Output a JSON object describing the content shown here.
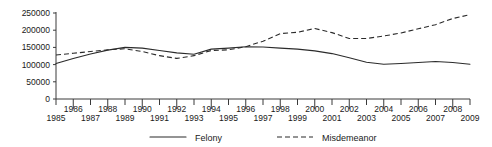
{
  "chart_data": {
    "type": "line",
    "title": "",
    "subtitle": "",
    "xlabel": "",
    "ylabel": "",
    "xlim": [
      1985,
      2009
    ],
    "ylim": [
      0,
      250000
    ],
    "grid": false,
    "legend_position": "bottom",
    "x": [
      1985,
      1986,
      1987,
      1988,
      1989,
      1990,
      1991,
      1992,
      1993,
      1994,
      1995,
      1996,
      1997,
      1998,
      1999,
      2000,
      2001,
      2002,
      2003,
      2004,
      2005,
      2006,
      2007,
      2008,
      2009
    ],
    "categories": [
      "1985",
      "1986",
      "1987",
      "1988",
      "1989",
      "1990",
      "1991",
      "1992",
      "1993",
      "1994",
      "1995",
      "1996",
      "1997",
      "1998",
      "1999",
      "2000",
      "2001",
      "2002",
      "2003",
      "2004",
      "2005",
      "2006",
      "2007",
      "2008",
      "2009"
    ],
    "ytick_labels": [
      "0",
      "50000",
      "100000",
      "150000",
      "200000",
      "250000"
    ],
    "ytick_values": [
      0,
      50000,
      100000,
      150000,
      200000,
      250000
    ],
    "xtick_labels_bottom": [
      "1985",
      "1987",
      "1989",
      "1991",
      "1993",
      "1995",
      "1997",
      "1999",
      "2001",
      "2003",
      "2005",
      "2007",
      "2009"
    ],
    "xtick_labels_top": [
      "1986",
      "1988",
      "1990",
      "1992",
      "1994",
      "1996",
      "1998",
      "2000",
      "2002",
      "2004",
      "2006",
      "2008"
    ],
    "series": [
      {
        "name": "Felony",
        "style": "solid",
        "color": "#2b2b2b",
        "values": [
          103000,
          118000,
          131000,
          142000,
          150000,
          148000,
          141000,
          134000,
          130000,
          145000,
          148000,
          152000,
          151000,
          148000,
          145000,
          140000,
          132000,
          120000,
          107000,
          101000,
          103000,
          106000,
          109000,
          106000,
          101000
        ]
      },
      {
        "name": "Misdemeanor",
        "style": "dashed",
        "color": "#2b2b2b",
        "values": [
          128000,
          133000,
          138000,
          143000,
          146000,
          138000,
          126000,
          118000,
          126000,
          141000,
          143000,
          152000,
          168000,
          190000,
          194000,
          205000,
          193000,
          176000,
          176000,
          183000,
          192000,
          204000,
          216000,
          234000,
          245000
        ]
      }
    ]
  },
  "legend": {
    "items": [
      {
        "label": "Felony",
        "style": "solid"
      },
      {
        "label": "Misdemeanor",
        "style": "dashed"
      }
    ]
  },
  "colors": {
    "axis": "#3a3a3a",
    "text": "#1a1a1a",
    "line": "#2b2b2b",
    "background": "#ffffff"
  }
}
